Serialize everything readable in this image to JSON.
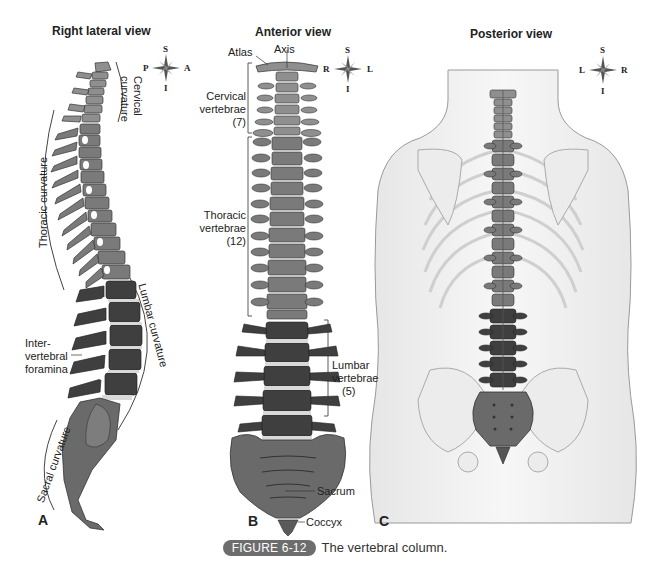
{
  "figure": {
    "badge": "FIGURE 6-12",
    "caption": "The vertebral column."
  },
  "panels": [
    {
      "letter": "A",
      "title": "Right lateral view",
      "compass": {
        "top": "S",
        "bottom": "I",
        "left": "P",
        "right": "A"
      },
      "labels": {
        "cervical_curvature_1": "Cervical",
        "cervical_curvature_2": "curvature",
        "thoracic_curvature": "Thoracic curvature",
        "lumbar_curvature": "Lumbar curvature",
        "sacral_curvature": "Sacral curvature",
        "intervertebral_1": "Inter-",
        "intervertebral_2": "vertebral",
        "intervertebral_3": "foramina"
      }
    },
    {
      "letter": "B",
      "title": "Anterior view",
      "compass": {
        "top": "S",
        "bottom": "I",
        "left": "R",
        "right": "L"
      },
      "labels": {
        "atlas": "Atlas",
        "axis": "Axis",
        "cervical_1": "Cervical",
        "cervical_2": "vertebrae",
        "cervical_3": "(7)",
        "thoracic_1": "Thoracic",
        "thoracic_2": "vertebrae",
        "thoracic_3": "(12)",
        "lumbar_1": "Lumbar",
        "lumbar_2": "vertebrae",
        "lumbar_3": "(5)",
        "sacrum": "Sacrum",
        "coccyx": "Coccyx"
      }
    },
    {
      "letter": "C",
      "title": "Posterior view",
      "compass": {
        "top": "S",
        "bottom": "I",
        "left": "L",
        "right": "R"
      }
    }
  ],
  "colors": {
    "cervical": "#8f8f8f",
    "thoracic": "#7a7a7a",
    "lumbar": "#3f3f3f",
    "sacrum": "#6a6a6a",
    "disc": "#d9d9d9",
    "body_outline": "#9a9a9a",
    "badge_bg": "#6d6d6d"
  }
}
